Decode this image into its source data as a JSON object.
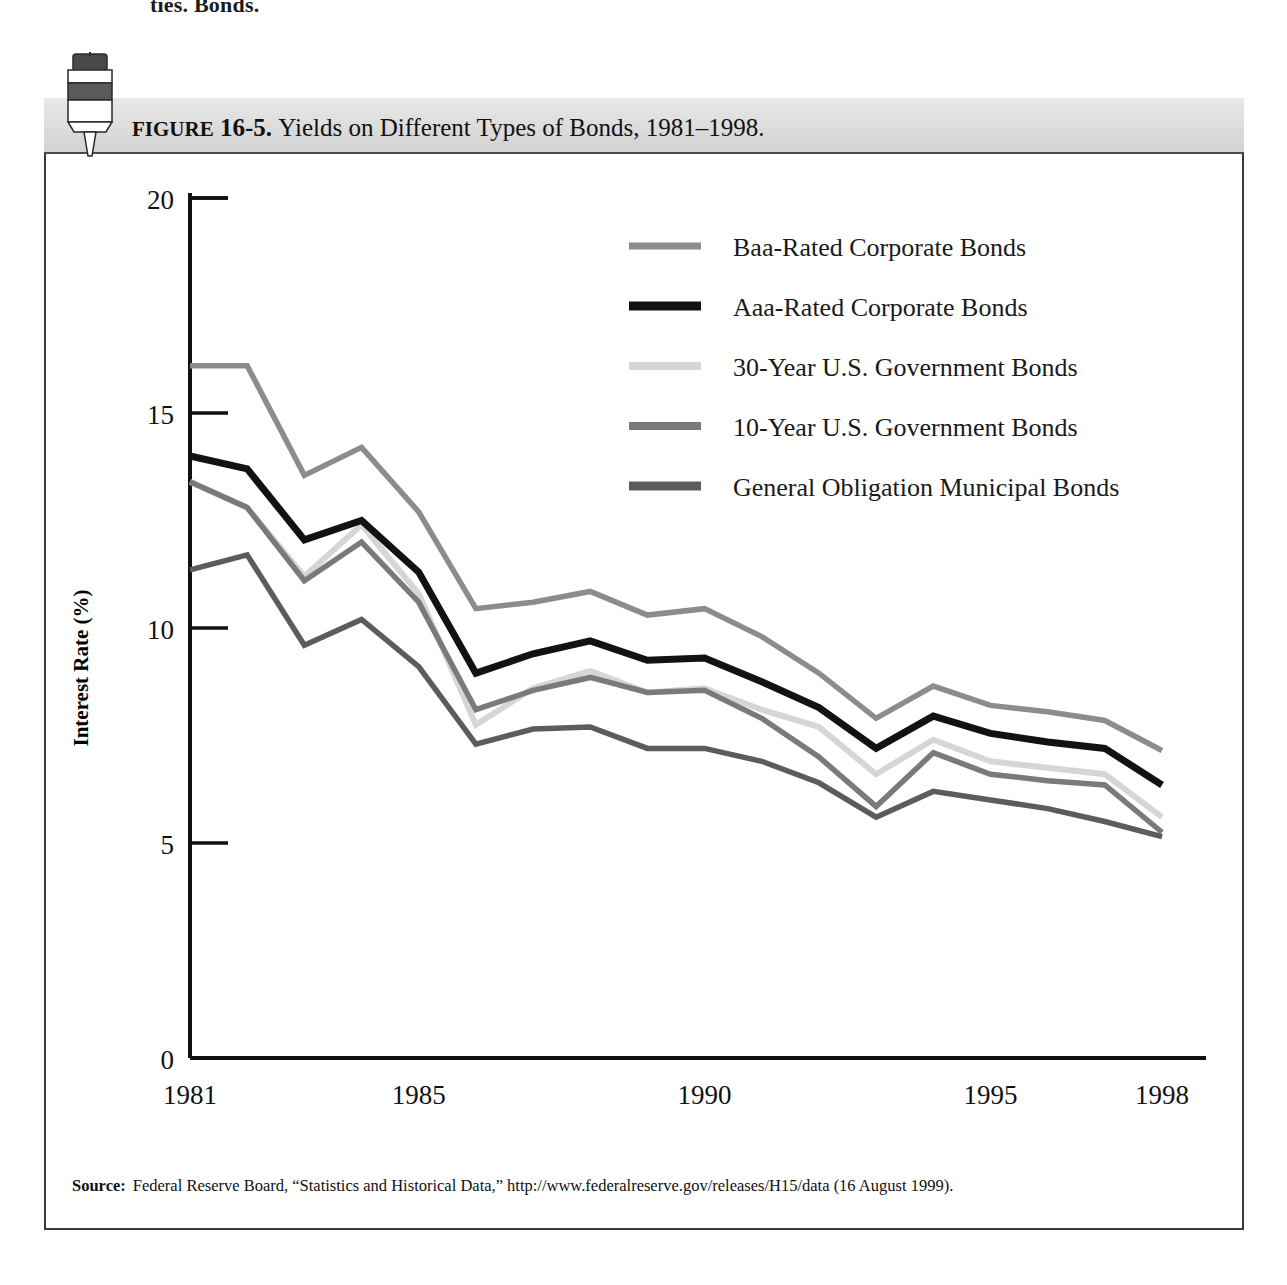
{
  "page": {
    "top_fragment": "ties. Bonds."
  },
  "figure": {
    "number_label": "FIGURE 16-5.",
    "figure_word": "FIGURE",
    "figure_id": "16-5.",
    "title": "Yields on Different Types of Bonds, 1981–1998.",
    "clip_icon": "binder-clip-icon"
  },
  "source": {
    "label": "Source:",
    "text": "Federal Reserve Board, “Statistics and Historical Data,” http://www.federalreserve.gov/releases/H15/data (16 August 1999)."
  },
  "colors": {
    "baa": "#8c8c8c",
    "aaa": "#121212",
    "gov30": "#d6d6d6",
    "gov10": "#7a7a7a",
    "muni": "#5c5c5c",
    "axis": "#111111",
    "frame": "#3a3a3a",
    "titlebar": "#dcdcdc"
  },
  "chart_data": {
    "type": "line",
    "title": "Yields on Different Types of Bonds, 1981–1998.",
    "xlabel": "Year",
    "ylabel": "Interest Rate (%)",
    "xlim": [
      1981,
      1998
    ],
    "ylim": [
      0,
      20
    ],
    "yticks": [
      0,
      5,
      10,
      15,
      20
    ],
    "xticks": [
      1981,
      1985,
      1990,
      1995,
      1998
    ],
    "xtick_labels": [
      "1981",
      "1985",
      "1990",
      "1995",
      "1998"
    ],
    "ytick_labels": [
      "0",
      "5",
      "10",
      "15",
      "20"
    ],
    "grid": false,
    "legend_position": "upper-right-inside",
    "x": [
      1981,
      1982,
      1983,
      1984,
      1985,
      1986,
      1987,
      1988,
      1989,
      1990,
      1991,
      1992,
      1993,
      1994,
      1995,
      1996,
      1997,
      1998
    ],
    "series": [
      {
        "name": "Baa-Rated Corporate Bonds",
        "color": "#8c8c8c",
        "values": [
          16.1,
          16.1,
          13.55,
          14.2,
          12.7,
          10.45,
          10.6,
          10.85,
          10.3,
          10.45,
          9.8,
          8.95,
          7.9,
          8.65,
          8.2,
          8.05,
          7.85,
          7.15
        ]
      },
      {
        "name": "Aaa-Rated Corporate Bonds",
        "color": "#121212",
        "values": [
          14.0,
          13.7,
          12.05,
          12.5,
          11.3,
          8.95,
          9.4,
          9.7,
          9.25,
          9.3,
          8.75,
          8.15,
          7.2,
          7.95,
          7.55,
          7.35,
          7.2,
          6.35
        ]
      },
      {
        "name": "30-Year U.S. Government Bonds",
        "color": "#d6d6d6",
        "values": [
          13.4,
          12.8,
          11.2,
          12.4,
          10.8,
          7.75,
          8.6,
          9.0,
          8.5,
          8.6,
          8.1,
          7.7,
          6.6,
          7.4,
          6.9,
          6.75,
          6.6,
          5.6
        ]
      },
      {
        "name": "10-Year U.S. Government Bonds",
        "color": "#7a7a7a",
        "values": [
          13.4,
          12.8,
          11.1,
          12.0,
          10.6,
          8.1,
          8.55,
          8.85,
          8.5,
          8.55,
          7.9,
          7.0,
          5.85,
          7.1,
          6.6,
          6.45,
          6.35,
          5.25
        ]
      },
      {
        "name": "General Obligation Municipal Bonds",
        "color": "#5c5c5c",
        "values": [
          11.35,
          11.7,
          9.6,
          10.2,
          9.1,
          7.3,
          7.65,
          7.7,
          7.2,
          7.2,
          6.9,
          6.4,
          5.6,
          6.2,
          6.0,
          5.8,
          5.5,
          5.15
        ]
      }
    ]
  },
  "legend": {
    "items": [
      {
        "label": "Baa-Rated Corporate Bonds",
        "color": "#8c8c8c",
        "weight": 7
      },
      {
        "label": "Aaa-Rated Corporate Bonds",
        "color": "#121212",
        "weight": 9
      },
      {
        "label": "30-Year U.S. Government Bonds",
        "color": "#d6d6d6",
        "weight": 8
      },
      {
        "label": "10-Year U.S. Government Bonds",
        "color": "#7a7a7a",
        "weight": 8
      },
      {
        "label": "General Obligation Municipal Bonds",
        "color": "#5c5c5c",
        "weight": 9
      }
    ]
  }
}
